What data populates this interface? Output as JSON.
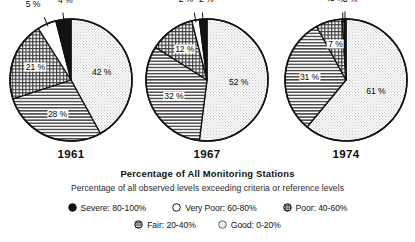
{
  "chart_data": {
    "type": "pie",
    "title": "Percentage of All Monitoring Stations",
    "subtitle": "Percentage of all observed levels exceeding criteria or reference levels",
    "categories": [
      "Severe: 80-100%",
      "Very Poor: 60-80%",
      "Poor: 40-60%",
      "Fair: 20-40%",
      "Good: 0-20%"
    ],
    "legend_position": "bottom",
    "charts": [
      {
        "name": "1961",
        "labels": [
          "4 %",
          "5 %",
          "21 %",
          "28 %",
          "42 %"
        ],
        "values": [
          4,
          5,
          21,
          28,
          42
        ]
      },
      {
        "name": "1967",
        "labels": [
          "2 %",
          "2 %",
          "12 %",
          "32 %",
          "52 %"
        ],
        "values": [
          2,
          2,
          12,
          32,
          52
        ]
      },
      {
        "name": "1974",
        "labels": [
          ".5 %",
          ".5 %",
          "7 %",
          "31 %",
          "61 %"
        ],
        "values": [
          0.5,
          0.5,
          7,
          31,
          61
        ]
      }
    ]
  },
  "caption": {
    "main": "Percentage of All Monitoring Stations",
    "sub": "Percentage of all observed levels exceeding criteria or reference levels"
  },
  "pies": [
    {
      "year": "1961",
      "slices": [
        {
          "key": "severe",
          "label": "4 %",
          "value": 4,
          "fill": "severe"
        },
        {
          "key": "very_poor",
          "label": "5 %",
          "value": 5,
          "fill": "very-poor"
        },
        {
          "key": "poor",
          "label": "21 %",
          "value": 21,
          "fill": "poor"
        },
        {
          "key": "fair",
          "label": "28 %",
          "value": 28,
          "fill": "fair"
        },
        {
          "key": "good",
          "label": "42 %",
          "value": 42,
          "fill": "good"
        }
      ]
    },
    {
      "year": "1967",
      "slices": [
        {
          "key": "severe",
          "label": "2 %",
          "value": 2,
          "fill": "severe"
        },
        {
          "key": "very_poor",
          "label": "2 %",
          "value": 2,
          "fill": "very-poor"
        },
        {
          "key": "poor",
          "label": "12 %",
          "value": 12,
          "fill": "poor"
        },
        {
          "key": "fair",
          "label": "32 %",
          "value": 32,
          "fill": "fair"
        },
        {
          "key": "good",
          "label": "52 %",
          "value": 52,
          "fill": "good"
        }
      ]
    },
    {
      "year": "1974",
      "slices": [
        {
          "key": "severe",
          "label": ".5 %",
          "value": 0.5,
          "fill": "severe"
        },
        {
          "key": "very_poor",
          "label": ".5 %",
          "value": 0.5,
          "fill": "very-poor"
        },
        {
          "key": "poor",
          "label": "7 %",
          "value": 7,
          "fill": "poor"
        },
        {
          "key": "fair",
          "label": "31 %",
          "value": 31,
          "fill": "fair"
        },
        {
          "key": "good",
          "label": "61 %",
          "value": 61,
          "fill": "good"
        }
      ]
    }
  ],
  "legend": {
    "rows": [
      [
        {
          "key": "severe",
          "label": "Severe: 80-100%",
          "swatch": "solid-black-circle-icon"
        },
        {
          "key": "very_poor",
          "label": "Very Poor: 60-80%",
          "swatch": "open-white-circle-icon"
        },
        {
          "key": "poor",
          "label": "Poor: 40-60%",
          "swatch": "crosshatch-circle-icon"
        }
      ],
      [
        {
          "key": "fair",
          "label": "Fair: 20-40%",
          "swatch": "horizontal-lines-circle-icon"
        },
        {
          "key": "good",
          "label": "Good: 0-20%",
          "swatch": "dotted-light-circle-icon"
        }
      ]
    ]
  },
  "colors": {
    "severe": "#111111",
    "very_poor": "#ffffff",
    "poor": "#b9b9b9",
    "fair": "#cfcfcf",
    "good": "#e4e4e4",
    "stroke": "#111111",
    "text": "#111111"
  }
}
